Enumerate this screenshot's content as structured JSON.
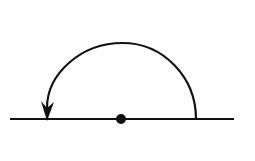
{
  "diagram": {
    "type": "rotation-arc-on-line",
    "background": "#ffffff",
    "stroke_color": "#111111",
    "line": {
      "x1": 10,
      "y1": 119,
      "x2": 234,
      "y2": 119,
      "width": 2.2
    },
    "center_dot": {
      "cx": 121,
      "cy": 119,
      "r": 5
    },
    "arc": {
      "start": [
        196,
        119
      ],
      "end": [
        47,
        112
      ],
      "apex_y": 43,
      "direction": "counterclockwise",
      "width": 2.2
    },
    "arrowhead": {
      "tip": [
        47,
        121
      ],
      "pointing": "down"
    }
  }
}
